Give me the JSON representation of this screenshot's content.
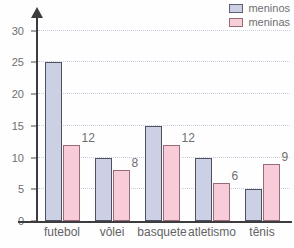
{
  "chart_data": {
    "type": "bar",
    "title": "",
    "xlabel": "",
    "ylabel": "",
    "ylim": [
      0,
      32
    ],
    "yticks": [
      0,
      5,
      10,
      15,
      20,
      25,
      30
    ],
    "grid": true,
    "legend_position": "top-right",
    "categories": [
      "futebol",
      "vôlei",
      "basquete",
      "atletismo",
      "tênis"
    ],
    "series": [
      {
        "name": "meninos",
        "color": "#ccd0e4",
        "border_color": "#4d5160",
        "values": [
          25,
          10,
          15,
          10,
          5
        ],
        "labels": [
          "",
          "",
          "",
          "",
          ""
        ]
      },
      {
        "name": "meninas",
        "color": "#f7ccd8",
        "border_color": "#9b6a77",
        "values": [
          12,
          8,
          12,
          6,
          9
        ],
        "labels": [
          "12",
          "8",
          "12",
          "6",
          "9"
        ]
      }
    ]
  },
  "legend": {
    "items": [
      {
        "label": "meninos",
        "swatch": "boys"
      },
      {
        "label": "meninas",
        "swatch": "girls"
      }
    ]
  },
  "axes": {
    "y_tick_labels": [
      "30",
      "25",
      "20",
      "15",
      "10",
      "5",
      "0"
    ],
    "x_tick_labels": [
      "futebol",
      "vôlei",
      "basquete",
      "atletismo",
      "tênis"
    ]
  },
  "title_sliver": ""
}
